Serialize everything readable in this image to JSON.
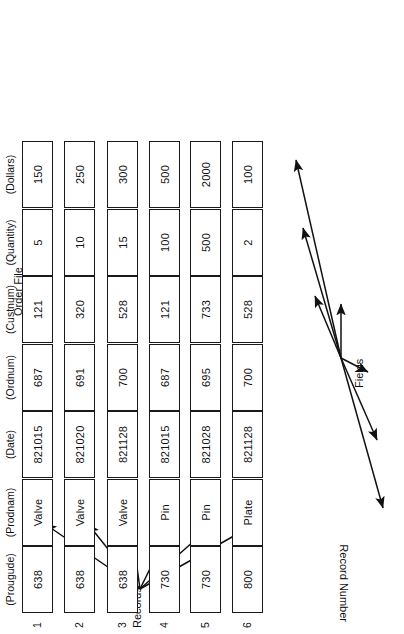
{
  "diagram": {
    "title_records": "Records",
    "title_fields": "Fields",
    "caption_order_file": "Order File",
    "caption_record_number": "Record Number"
  },
  "fields": [
    {
      "name": "Product\nCode",
      "name_line1": "Product",
      "name_line2": "Code",
      "code": "(Prougude)"
    },
    {
      "name": "Product\nName",
      "name_line1": "Product",
      "name_line2": "Name",
      "code": "(Prodnam)"
    },
    {
      "name": "Data",
      "name_line1": "Data",
      "name_line2": "",
      "code": "(Date)"
    },
    {
      "name": "Order\nNumber",
      "name_line1": "Order",
      "name_line2": "Number",
      "code": "(Ordnum)"
    },
    {
      "name": "Customer\nNumber",
      "name_line1": "Customer",
      "name_line2": "Number",
      "code": "(Custnum)"
    },
    {
      "name": "Quantity",
      "name_line1": "Quantity",
      "name_line2": "",
      "code": "(Quantity)"
    },
    {
      "name": "Dollars",
      "name_line1": "Dollars",
      "name_line2": "",
      "code": "(Dollars)"
    }
  ],
  "record_numbers": [
    "1",
    "2",
    "3",
    "4",
    "5",
    "6"
  ],
  "records": [
    {
      "num": "1",
      "prougude": "638",
      "prodnam": "Valve",
      "date": "821015",
      "ordnum": "687",
      "custnum": "121",
      "quantity": "5",
      "dollars": "150"
    },
    {
      "num": "2",
      "prougude": "638",
      "prodnam": "Valve",
      "date": "821020",
      "ordnum": "691",
      "custnum": "320",
      "quantity": "10",
      "dollars": "250"
    },
    {
      "num": "3",
      "prougude": "638",
      "prodnam": "Valve",
      "date": "821128",
      "ordnum": "700",
      "custnum": "528",
      "quantity": "15",
      "dollars": "300"
    },
    {
      "num": "4",
      "prougude": "730",
      "prodnam": "Pin",
      "date": "821015",
      "ordnum": "687",
      "custnum": "121",
      "quantity": "100",
      "dollars": "500"
    },
    {
      "num": "5",
      "prougude": "730",
      "prodnam": "Pin",
      "date": "821028",
      "ordnum": "695",
      "custnum": "733",
      "quantity": "500",
      "dollars": "2000"
    },
    {
      "num": "6",
      "prougude": "800",
      "prodnam": "Plate",
      "date": "821128",
      "ordnum": "700",
      "custnum": "528",
      "quantity": "2",
      "dollars": "100"
    }
  ],
  "colors": {
    "ink": "#111111",
    "line": "#1a1a1a",
    "paper": "#ffffff"
  }
}
